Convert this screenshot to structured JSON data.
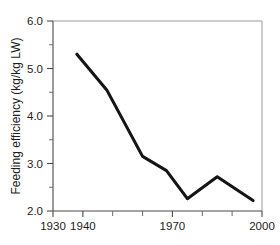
{
  "chart_data": {
    "type": "line",
    "title": "",
    "xlabel": "",
    "ylabel": "Feeding efficiency (kg/kg LW)",
    "xlim": [
      1930,
      2000
    ],
    "ylim": [
      2.0,
      6.0
    ],
    "grid": false,
    "legend": false,
    "x_ticks_major": [
      1930,
      1940,
      1970,
      2000
    ],
    "x_tick_labels": [
      "1930",
      "1940",
      "1970",
      "2000"
    ],
    "x_ticks_minor": [
      1950,
      1960,
      1980,
      1990
    ],
    "y_ticks_major": [
      2.0,
      3.0,
      4.0,
      5.0,
      6.0
    ],
    "y_tick_labels": [
      "2.0",
      "3.0",
      "4.0",
      "5.0",
      "6.0"
    ],
    "y_ticks_minor": [
      2.5,
      3.5,
      4.5,
      5.5
    ],
    "line_color": "#151515",
    "series": [
      {
        "name": "Feeding efficiency",
        "x": [
          1938,
          1948,
          1960,
          1968,
          1975,
          1985,
          1997
        ],
        "values": [
          5.3,
          4.55,
          3.15,
          2.85,
          2.26,
          2.72,
          2.22
        ]
      }
    ]
  },
  "axes": {
    "y_title": "Feeding efficiency (kg/kg LW)",
    "y_labels": [
      "6.0",
      "5.0",
      "4.0",
      "3.0",
      "2.0"
    ],
    "x_labels": [
      "1930",
      "1940",
      "1970",
      "2000"
    ]
  }
}
